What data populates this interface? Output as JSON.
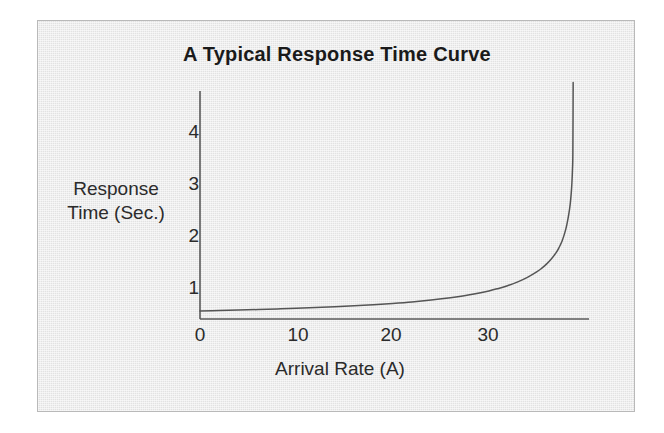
{
  "figure": {
    "panel_background": "#e2e2e2",
    "panel_border_color": "#b9b9b9",
    "outer_background": "#ffffff",
    "ink_color": "#555555",
    "text_color": "#2b2b2b"
  },
  "chart_data": {
    "type": "line",
    "title": "A Typical Response Time Curve",
    "xlabel": "Arrival Rate (A)",
    "ylabel": "Response Time (Sec.)",
    "ylabel_lines": [
      "Response",
      "Time (Sec.)"
    ],
    "xlim": [
      0,
      40.5
    ],
    "ylim": [
      0,
      4.6
    ],
    "grid": false,
    "legend": null,
    "axis_style": "left-and-bottom-spines",
    "xticks": [
      0,
      10,
      20,
      30
    ],
    "xtick_labels": [
      "0",
      "10",
      "20",
      "30"
    ],
    "yticks": [
      1,
      2,
      3,
      4
    ],
    "ytick_labels": [
      "1",
      "2",
      "3",
      "4"
    ],
    "annotations": [
      "Curve is flat near 0.15 sec until the knee, then rises asymptotically",
      "Vertical asymptote near Arrival Rate = 39"
    ],
    "series": [
      {
        "name": "Response Time",
        "color": "#555555",
        "asymptote_x": 39,
        "baseline_y": 0.15,
        "knee_x": 37,
        "x": [
          0,
          2,
          4,
          6,
          8,
          10,
          12,
          14,
          16,
          18,
          20,
          22,
          24,
          26,
          28,
          30,
          31,
          32,
          33,
          34,
          35,
          35.5,
          36,
          36.5,
          37,
          37.3,
          37.6,
          37.9,
          38.1,
          38.3,
          38.45,
          38.55,
          38.62,
          38.68,
          38.72,
          38.75
        ],
        "y": [
          0.155,
          0.163,
          0.172,
          0.182,
          0.193,
          0.205,
          0.219,
          0.235,
          0.254,
          0.275,
          0.3,
          0.329,
          0.365,
          0.409,
          0.465,
          0.54,
          0.588,
          0.645,
          0.714,
          0.8,
          0.91,
          0.979,
          1.06,
          1.16,
          1.28,
          1.38,
          1.5,
          1.67,
          1.82,
          2.02,
          2.22,
          2.42,
          2.62,
          2.88,
          3.2,
          4.55
        ]
      }
    ]
  }
}
